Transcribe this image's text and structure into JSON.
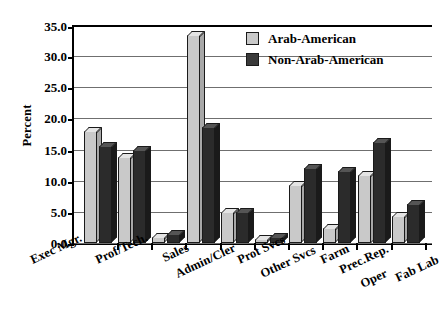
{
  "chart_data": {
    "type": "bar",
    "title": "",
    "xlabel": "",
    "ylabel": "Percent",
    "ylim": [
      0,
      35
    ],
    "ytick_labels": [
      "0.0",
      "5.0",
      "10.0",
      "15.0",
      "20.0",
      "25.0",
      "30.0",
      "35.0"
    ],
    "ytick_values": [
      0,
      5,
      10,
      15,
      20,
      25,
      30,
      35
    ],
    "grid": true,
    "legend_position": "upper right",
    "categories": [
      "Exec Mgr.",
      "Prof/Tech.",
      "Sales",
      "Admin/Cler",
      "Prot Svcs",
      "Other Svcs",
      "Farm",
      "Prec.Rep.",
      "Oper",
      "Fab Lab"
    ],
    "series": [
      {
        "name": "Arab-American",
        "color": "#c9c9c9",
        "values": [
          18.0,
          13.8,
          0.9,
          33.4,
          4.9,
          0.7,
          9.3,
          2.4,
          11.0,
          4.4
        ]
      },
      {
        "name": "Non-Arab-American",
        "color": "#2b2b2b",
        "values": [
          15.5,
          15.0,
          1.5,
          18.6,
          4.9,
          1.0,
          12.0,
          11.6,
          16.2,
          6.3
        ]
      }
    ]
  },
  "legend": {
    "items": [
      {
        "label": "Arab-American",
        "swatch": "light"
      },
      {
        "label": "Non-Arab-American",
        "swatch": "dark"
      }
    ]
  }
}
